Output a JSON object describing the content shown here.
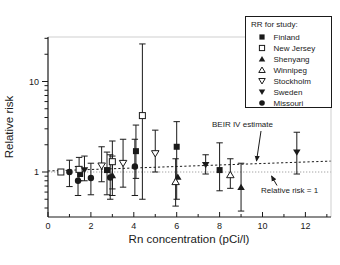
{
  "chart_data": {
    "type": "scatter",
    "title": "",
    "xlabel": "Rn concentration (pCi/l)",
    "ylabel": "Relative risk",
    "x_axis": {
      "min": 0,
      "max": 13.2,
      "major_ticks": [
        0,
        2,
        4,
        6,
        8,
        10,
        12
      ],
      "minor_ticks": [
        1,
        3,
        5,
        7,
        9,
        11,
        13
      ]
    },
    "y_axis": {
      "scale": "log",
      "min": 0.32,
      "max": 31,
      "major_ticks": [
        1,
        10
      ],
      "minor_ticks": [
        0.4,
        0.5,
        0.6,
        0.7,
        0.8,
        0.9,
        2,
        3,
        4,
        5,
        6,
        7,
        8,
        9,
        20,
        30
      ]
    },
    "legend": {
      "title": "RR for study:",
      "position": "top-right"
    },
    "series": [
      {
        "name": "Finland",
        "marker": "square-filled",
        "points": [
          {
            "x": 1.5,
            "y": 0.95
          },
          {
            "x": 2.75,
            "y": 1.05,
            "lo": 0.56,
            "hi": 1.66
          },
          {
            "x": 4.1,
            "y": 1.7,
            "lo": 0.85,
            "hi": 3.3
          },
          {
            "x": 6.0,
            "y": 1.9,
            "lo": 0.5,
            "hi": 3.6
          },
          {
            "x": 8.0,
            "y": 1.05,
            "lo": 0.62,
            "hi": 2.1
          }
        ]
      },
      {
        "name": "New Jersey",
        "marker": "square-open",
        "points": [
          {
            "x": 0.6,
            "y": 1.0
          },
          {
            "x": 1.45,
            "y": 1.07,
            "lo": 0.8,
            "hi": 1.45
          },
          {
            "x": 3.0,
            "y": 1.3,
            "lo": 0.65,
            "hi": 2.2
          },
          {
            "x": 4.4,
            "y": 4.2,
            "lo": 0.5,
            "hi": 26
          }
        ]
      },
      {
        "name": "Shenyang",
        "marker": "triangle-up-filled",
        "points": [
          {
            "x": 3.0,
            "y": 0.92,
            "lo": 0.55,
            "hi": 1.5
          },
          {
            "x": 6.05,
            "y": 0.88
          },
          {
            "x": 9.0,
            "y": 0.68,
            "lo": 0.37,
            "hi": 1.25
          }
        ]
      },
      {
        "name": "Winnipeg",
        "marker": "triangle-up-open",
        "points": [
          {
            "x": 5.95,
            "y": 0.78,
            "lo": 0.42,
            "hi": 1.4
          },
          {
            "x": 8.5,
            "y": 0.93,
            "lo": 0.66,
            "hi": 1.4
          }
        ]
      },
      {
        "name": "Stockholm",
        "marker": "triangle-down-open",
        "points": [
          {
            "x": 2.5,
            "y": 1.17,
            "lo": 0.78,
            "hi": 1.9
          },
          {
            "x": 3.5,
            "y": 1.25,
            "lo": 0.68,
            "hi": 2.3
          },
          {
            "x": 5.0,
            "y": 1.6,
            "lo": 1.0,
            "hi": 2.9
          }
        ]
      },
      {
        "name": "Sweden",
        "marker": "triangle-down-filled",
        "points": [
          {
            "x": 1.7,
            "y": 1.05,
            "lo": 0.8,
            "hi": 1.5
          },
          {
            "x": 7.35,
            "y": 1.2,
            "lo": 0.95,
            "hi": 1.55
          },
          {
            "x": 11.6,
            "y": 1.65,
            "lo": 0.95,
            "hi": 2.75
          }
        ]
      },
      {
        "name": "Missouri",
        "marker": "circle-filled",
        "points": [
          {
            "x": 1.0,
            "y": 1.0,
            "lo": 0.69,
            "hi": 1.35
          },
          {
            "x": 1.4,
            "y": 0.8,
            "lo": 0.55,
            "hi": 1.15
          },
          {
            "x": 2.0,
            "y": 0.86,
            "lo": 0.56,
            "hi": 1.25
          },
          {
            "x": 2.9,
            "y": 0.87,
            "lo": 0.5,
            "hi": 1.55
          },
          {
            "x": 4.05,
            "y": 1.15,
            "lo": 0.55,
            "hi": 2.3
          }
        ]
      }
    ],
    "reference_lines": [
      {
        "name": "beir-iv",
        "label": "BEIR IV estimate",
        "style": "dotted-black",
        "x1": 0,
        "y1": 1.0,
        "x2": 13.2,
        "y2": 1.32
      },
      {
        "name": "unity",
        "label": "Relative risk = 1",
        "style": "thin-dotted-gray",
        "x1": 0,
        "y1": 1.0,
        "x2": 13.2,
        "y2": 1.0
      }
    ],
    "annotations": [
      {
        "text": "BEIR IV estimate",
        "points_to": "beir-iv"
      },
      {
        "text": "Relative risk = 1",
        "points_to": "unity"
      }
    ]
  },
  "colors": {
    "ink": "#1a1a1a",
    "unity_line": "#9a9a9a",
    "frame_faint": "#cfcfcf",
    "background": "#ffffff"
  }
}
